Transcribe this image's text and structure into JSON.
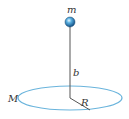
{
  "diagram": {
    "labels": {
      "mass_point": "m",
      "distance": "b",
      "ring_mass": "M",
      "radius": "R"
    },
    "colors": {
      "ring": "#6ab4dc",
      "line": "#555555",
      "ball": "#2a7fbf"
    }
  }
}
